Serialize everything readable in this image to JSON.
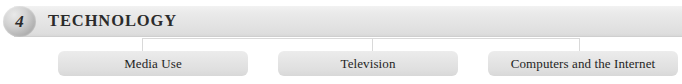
{
  "header": {
    "chapter_number": "4",
    "title": "TECHNOLOGY",
    "band_color": "#e6e6e6",
    "badge_color": "#b4b4b4",
    "title_color": "#2b2b2b"
  },
  "connectors": {
    "line_color": "#d9d9d9",
    "count": 3
  },
  "topics": [
    {
      "label": "Media Use"
    },
    {
      "label": "Television"
    },
    {
      "label": "Computers and the Internet"
    }
  ]
}
